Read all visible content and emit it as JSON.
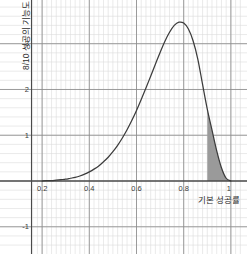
{
  "chart_data": {
    "type": "line",
    "title": "",
    "subtitle": "",
    "xlabel": "기본 성공률",
    "ylabel": "8/10 성공의 기능도",
    "xlim": [
      0.155,
      1.045
    ],
    "ylim": [
      -1.42,
      3.78
    ],
    "xticks": [
      0.2,
      0.4,
      0.6,
      0.8,
      1
    ],
    "xtick_labels": [
      "0.2",
      "0.4",
      "0.6",
      "0.8",
      "1"
    ],
    "yticks": [
      -1,
      1,
      2,
      3
    ],
    "ytick_labels": [
      "-1",
      "1",
      "2",
      "3"
    ],
    "grid": true,
    "grid_major_color": "#8c8c8c",
    "grid_minor_color": "#dcdcdc",
    "axis_color": "#4a4a4a",
    "curve_color": "#3c3c3c",
    "fill_color": "#9a9a9a",
    "legend": [],
    "annotations": [],
    "shaded_region": {
      "x_start": 0.9,
      "x_end": 1.0,
      "label": ""
    },
    "peak": {
      "x": 0.875,
      "y": 3.45
    },
    "x": [
      0.2,
      0.22,
      0.24,
      0.26,
      0.28,
      0.3,
      0.32,
      0.34,
      0.36,
      0.38,
      0.4,
      0.42,
      0.44,
      0.46,
      0.48,
      0.5,
      0.52,
      0.54,
      0.56,
      0.58,
      0.6,
      0.62,
      0.64,
      0.66,
      0.68,
      0.7,
      0.72,
      0.74,
      0.76,
      0.78,
      0.8,
      0.82,
      0.84,
      0.86,
      0.88,
      0.9,
      0.92,
      0.94,
      0.96,
      0.98,
      1.0
    ],
    "y": [
      0.0,
      0.01,
      0.01,
      0.02,
      0.03,
      0.04,
      0.06,
      0.08,
      0.11,
      0.15,
      0.2,
      0.26,
      0.33,
      0.42,
      0.52,
      0.64,
      0.78,
      0.94,
      1.12,
      1.32,
      1.54,
      1.78,
      2.03,
      2.29,
      2.55,
      2.81,
      3.05,
      3.25,
      3.4,
      3.47,
      3.45,
      3.32,
      3.06,
      2.66,
      2.11,
      1.57,
      1.11,
      0.66,
      0.29,
      0.06,
      0.0
    ],
    "series": [
      {
        "name": "8/10 성공의 기능도",
        "values": [
          0.0,
          0.01,
          0.01,
          0.02,
          0.03,
          0.04,
          0.06,
          0.08,
          0.11,
          0.15,
          0.2,
          0.26,
          0.33,
          0.42,
          0.52,
          0.64,
          0.78,
          0.94,
          1.12,
          1.32,
          1.54,
          1.78,
          2.03,
          2.29,
          2.55,
          2.81,
          3.05,
          3.25,
          3.4,
          3.47,
          3.45,
          3.32,
          3.06,
          2.66,
          2.11,
          1.57,
          1.11,
          0.66,
          0.29,
          0.06,
          0.0
        ]
      }
    ]
  }
}
